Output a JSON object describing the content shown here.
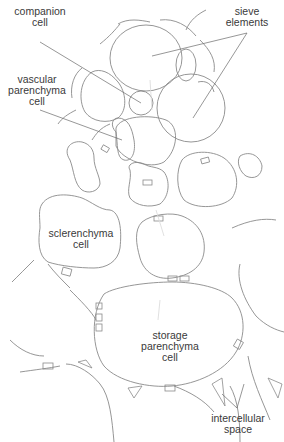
{
  "diagram": {
    "type": "plant tissue cross-section",
    "labels": {
      "companion_cell": [
        "companion",
        "cell"
      ],
      "sieve_elements": [
        "sieve",
        "elements"
      ],
      "vascular_parenchyma_cell": [
        "vascular",
        "parenchyma",
        "cell"
      ],
      "sclerenchyma_cell": [
        "sclerenchyma",
        "cell"
      ],
      "storage_parenchyma_cell": [
        "storage",
        "parenchyma",
        "cell"
      ],
      "intercellular_space": [
        "intercellular",
        "space"
      ]
    },
    "colors": {
      "line": "#8a8a8a",
      "text": "#3a3a3a",
      "flow_arrow": "#dcdcdc",
      "background": "#ffffff"
    }
  }
}
